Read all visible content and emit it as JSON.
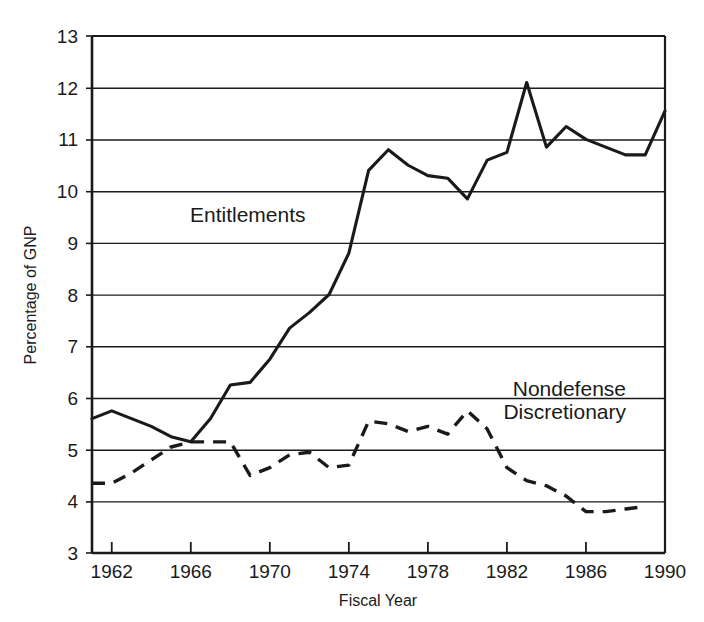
{
  "chart_data": {
    "type": "line",
    "title": "",
    "xlabel": "Fiscal Year",
    "ylabel": "Percentage of GNP",
    "xlim": [
      1961,
      1990
    ],
    "ylim": [
      3,
      13
    ],
    "xticks": [
      1962,
      1966,
      1970,
      1974,
      1978,
      1982,
      1986,
      1990
    ],
    "xtick_labels": [
      "1962",
      "1966",
      "1970",
      "1974",
      "1978",
      "1982",
      "1986",
      "1990"
    ],
    "yticks": [
      3,
      4,
      5,
      6,
      7,
      8,
      9,
      10,
      11,
      12,
      13
    ],
    "ytick_labels": [
      "3",
      "4",
      "5",
      "6",
      "7",
      "8",
      "9",
      "10",
      "11",
      "12",
      "13"
    ],
    "grid": "horizontal",
    "legend_position": "inline-annotations",
    "x": [
      1961,
      1962,
      1963,
      1964,
      1965,
      1966,
      1967,
      1968,
      1969,
      1970,
      1971,
      1972,
      1973,
      1974,
      1975,
      1976,
      1977,
      1978,
      1979,
      1980,
      1981,
      1982,
      1983,
      1984,
      1985,
      1986,
      1987,
      1988,
      1989
    ],
    "series": [
      {
        "name": "Entitlements",
        "style": "solid",
        "color": "#1a1a1a",
        "label_text": "Entitlements",
        "values": [
          5.6,
          5.75,
          5.6,
          5.45,
          5.25,
          5.15,
          5.6,
          6.25,
          6.3,
          6.75,
          7.35,
          7.65,
          8.0,
          8.8,
          10.4,
          10.8,
          10.5,
          10.3,
          10.25,
          9.85,
          10.6,
          10.75,
          12.1,
          10.85,
          11.25,
          11.0,
          10.85,
          10.7,
          10.7
        ]
      },
      {
        "name": "Nondefense Discretionary",
        "style": "dashed",
        "color": "#1a1a1a",
        "label_line1": "Nondefense",
        "label_line2": "Discretionary",
        "values": [
          4.35,
          4.35,
          4.55,
          4.8,
          5.05,
          5.15,
          5.15,
          5.15,
          4.5,
          4.65,
          4.9,
          4.95,
          4.65,
          4.7,
          5.55,
          5.5,
          5.35,
          5.45,
          5.3,
          5.75,
          5.4,
          4.65,
          4.4,
          4.3,
          4.1,
          3.8,
          3.8,
          3.85,
          3.9
        ]
      }
    ],
    "entitlements_final_value": 11.55,
    "entitlements_final_x": 1990
  }
}
